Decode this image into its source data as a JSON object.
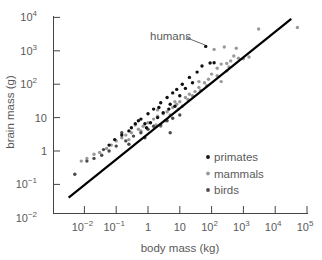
{
  "chart_data": {
    "type": "scatter",
    "title": "",
    "xlabel": "body mass (kg)",
    "ylabel": "brain mass (g)",
    "xscale": "log",
    "yscale": "log",
    "xlim": [
      0.003,
      100000
    ],
    "ylim": [
      0.01,
      10000
    ],
    "grid": false,
    "legend_position": "lower right",
    "x_ticks": [
      {
        "value": 0.01,
        "base": "10",
        "exp": "−2"
      },
      {
        "value": 0.1,
        "base": "10",
        "exp": "−1"
      },
      {
        "value": 1,
        "base": "1",
        "exp": ""
      },
      {
        "value": 10,
        "base": "10",
        "exp": ""
      },
      {
        "value": 100,
        "base": "10",
        "exp": "2"
      },
      {
        "value": 1000,
        "base": "10",
        "exp": "3"
      },
      {
        "value": 10000,
        "base": "10",
        "exp": "4"
      },
      {
        "value": 100000,
        "base": "10",
        "exp": "5"
      }
    ],
    "y_ticks": [
      {
        "value": 0.01,
        "base": "10",
        "exp": "−2"
      },
      {
        "value": 0.1,
        "base": "10",
        "exp": "−1"
      },
      {
        "value": 1,
        "base": "1",
        "exp": ""
      },
      {
        "value": 10,
        "base": "10",
        "exp": ""
      },
      {
        "value": 100,
        "base": "10",
        "exp": "2"
      },
      {
        "value": 1000,
        "base": "10",
        "exp": "3"
      },
      {
        "value": 10000,
        "base": "10",
        "exp": "4"
      }
    ],
    "fit_line": {
      "x": [
        0.0032,
        32000
      ],
      "y": [
        0.04,
        9000
      ],
      "color": "#000000"
    },
    "annotations": [
      {
        "text": "humans",
        "x": 65,
        "y": 1350
      }
    ],
    "series": [
      {
        "name": "primates",
        "color": "#111111",
        "points": [
          [
            65,
            1350
          ],
          [
            0.06,
            1.5
          ],
          [
            0.09,
            2.2
          ],
          [
            0.15,
            3.0
          ],
          [
            0.25,
            4.0
          ],
          [
            0.4,
            6.5
          ],
          [
            0.6,
            9.0
          ],
          [
            1.0,
            13
          ],
          [
            1.5,
            18
          ],
          [
            2.5,
            28
          ],
          [
            4,
            40
          ],
          [
            6,
            55
          ],
          [
            8,
            70
          ],
          [
            12,
            100
          ],
          [
            20,
            160
          ],
          [
            35,
            230
          ],
          [
            50,
            350
          ],
          [
            90,
            430
          ],
          [
            120,
            440
          ],
          [
            0.9,
            5
          ],
          [
            1.2,
            7
          ],
          [
            2,
            10
          ],
          [
            3,
            14
          ],
          [
            5,
            25
          ],
          [
            7,
            22
          ],
          [
            15,
            75
          ],
          [
            25,
            110
          ],
          [
            0.3,
            5
          ],
          [
            0.5,
            8
          ],
          [
            0.8,
            6.5
          ],
          [
            10,
            45
          ],
          [
            2.2,
            20
          ],
          [
            4.5,
            18
          ]
        ]
      },
      {
        "name": "mammals",
        "color": "#9a9a9a",
        "points": [
          [
            0.008,
            0.5
          ],
          [
            0.012,
            0.6
          ],
          [
            0.02,
            0.8
          ],
          [
            0.03,
            0.9
          ],
          [
            0.05,
            1.2
          ],
          [
            0.07,
            1.5
          ],
          [
            0.1,
            2.0
          ],
          [
            0.15,
            2.5
          ],
          [
            0.2,
            3.0
          ],
          [
            0.3,
            3.5
          ],
          [
            0.5,
            4.5
          ],
          [
            0.7,
            5.5
          ],
          [
            1,
            7
          ],
          [
            1.5,
            9
          ],
          [
            2,
            11
          ],
          [
            3,
            13
          ],
          [
            4,
            15
          ],
          [
            6,
            20
          ],
          [
            8,
            25
          ],
          [
            10,
            30
          ],
          [
            15,
            40
          ],
          [
            20,
            50
          ],
          [
            30,
            60
          ],
          [
            40,
            80
          ],
          [
            60,
            110
          ],
          [
            80,
            140
          ],
          [
            100,
            200
          ],
          [
            150,
            300
          ],
          [
            200,
            400
          ],
          [
            300,
            420
          ],
          [
            400,
            500
          ],
          [
            500,
            700
          ],
          [
            700,
            600
          ],
          [
            1000,
            580
          ],
          [
            1500,
            650
          ],
          [
            3000,
            4500
          ],
          [
            50000,
            5000
          ],
          [
            120,
            1100
          ],
          [
            250,
            1300
          ],
          [
            2,
            17
          ],
          [
            5,
            12
          ],
          [
            9,
            18
          ],
          [
            12,
            22
          ],
          [
            18,
            35
          ],
          [
            25,
            45
          ],
          [
            45,
            65
          ],
          [
            70,
            90
          ],
          [
            0.4,
            6
          ],
          [
            0.6,
            4
          ],
          [
            0.25,
            2.2
          ],
          [
            1.8,
            6
          ],
          [
            3.5,
            8
          ],
          [
            150,
            180
          ],
          [
            300,
            250
          ],
          [
            350,
            330
          ],
          [
            600,
            1200
          ],
          [
            200,
            120
          ],
          [
            2.5,
            5.5
          ],
          [
            7,
            30
          ],
          [
            40,
            120
          ]
        ]
      },
      {
        "name": "birds",
        "color": "#4a4a4a",
        "points": [
          [
            0.005,
            0.2
          ],
          [
            0.012,
            0.5
          ],
          [
            0.02,
            0.6
          ],
          [
            0.035,
            0.75
          ],
          [
            0.06,
            1.0
          ],
          [
            0.1,
            1.4
          ],
          [
            0.2,
            2.0
          ],
          [
            0.35,
            2.8
          ],
          [
            0.6,
            3.5
          ],
          [
            1.0,
            4.5
          ],
          [
            1.5,
            5.5
          ],
          [
            2.5,
            6.0
          ],
          [
            4,
            8.0
          ],
          [
            6,
            9.5
          ],
          [
            10,
            12
          ],
          [
            0.8,
            2.5
          ],
          [
            0.15,
            3.5
          ],
          [
            0.25,
            1.6
          ],
          [
            0.04,
            1.1
          ],
          [
            5,
            3.5
          ]
        ]
      }
    ]
  },
  "legend": {
    "items": [
      {
        "label": "primates",
        "color": "#111111"
      },
      {
        "label": "mammals",
        "color": "#9a9a9a"
      },
      {
        "label": "birds",
        "color": "#4a4a4a"
      }
    ]
  }
}
